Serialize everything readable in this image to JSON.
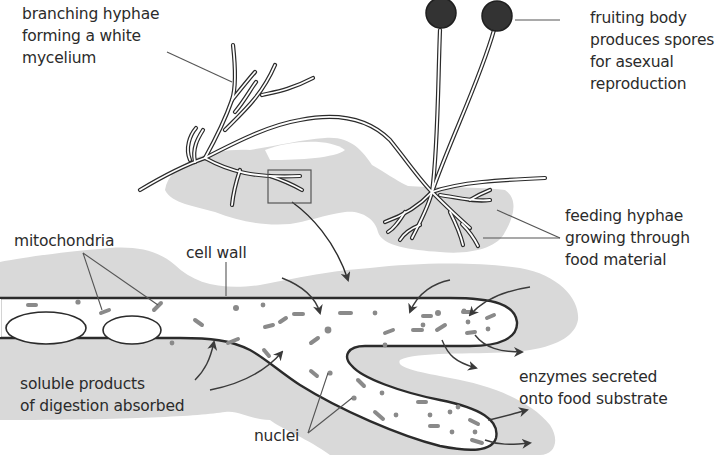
{
  "diagram": {
    "colors": {
      "background": "#ffffff",
      "food_substrate": "#d9d9d9",
      "outline": "#2b2b2b",
      "sporangium": "#333333",
      "organelle": "#8a8a8a",
      "text": "#2b2b2b"
    },
    "labels": {
      "branching_hyphae": [
        "branching hyphae",
        "forming a white",
        "mycelium"
      ],
      "fruiting_body": [
        "fruiting body",
        "produces spores",
        "for asexual",
        "reproduction"
      ],
      "feeding_hyphae": [
        "feeding hyphae",
        "growing through",
        "food material"
      ],
      "mitochondria": [
        "mitochondria"
      ],
      "cell_wall": [
        "cell wall"
      ],
      "soluble_products": [
        "soluble products",
        "of digestion absorbed"
      ],
      "enzymes": [
        "enzymes secreted",
        "onto food substrate"
      ],
      "nuclei": [
        "nuclei"
      ]
    },
    "components": [
      "mycelium",
      "sporangiophores",
      "sporangia",
      "rhizoids / feeding hyphae",
      "food substrate",
      "magnified hypha",
      "cell wall",
      "mitochondria",
      "nuclei",
      "vacuoles",
      "enzyme arrows",
      "absorption arrows"
    ]
  }
}
